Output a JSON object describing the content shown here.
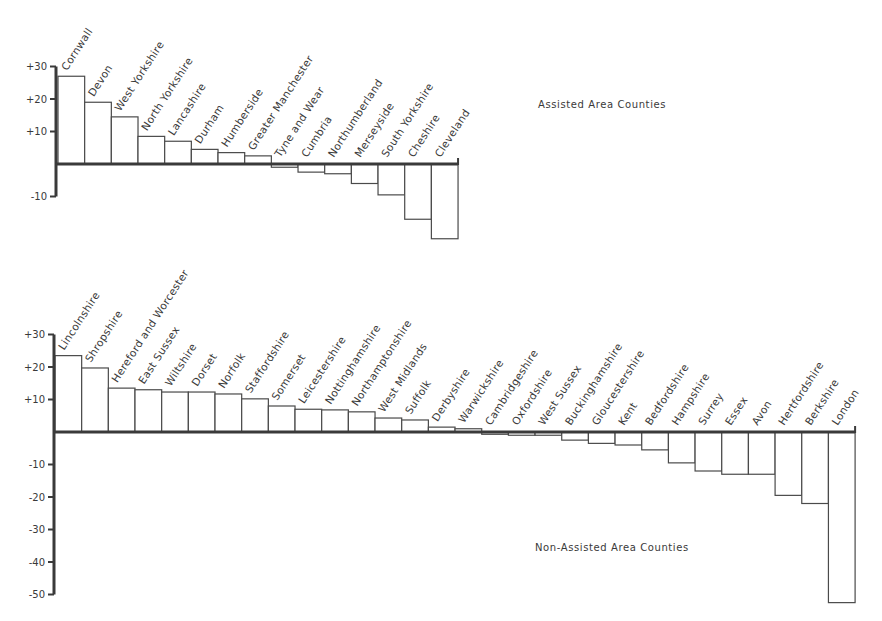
{
  "chart_data": [
    {
      "type": "bar",
      "title": "Assisted Area Counties",
      "xlabel": "",
      "ylabel": "",
      "ylim": [
        -10,
        30
      ],
      "yticks": [
        30,
        20,
        10,
        -10
      ],
      "ytick_labels": [
        "+30",
        "+20",
        "+10",
        "-10"
      ],
      "grid": false,
      "label_rotation": -57,
      "categories": [
        "Cornwall",
        "Devon",
        "West Yorkshire",
        "North Yorkshire",
        "Lancashire",
        "Durham",
        "Humberside",
        "Greater Manchester",
        "Tyne and Wear",
        "Cumbria",
        "Northumberland",
        "Merseyside",
        "South Yorkshire",
        "Cheshire",
        "Cleveland"
      ],
      "values": [
        27,
        19,
        14.5,
        8.5,
        7,
        4.5,
        3.5,
        2.5,
        -1,
        -2.5,
        -3,
        -6,
        -9.5,
        -17,
        -23
      ]
    },
    {
      "type": "bar",
      "title": "Non-Assisted Area Counties",
      "xlabel": "",
      "ylabel": "",
      "ylim": [
        -50,
        30
      ],
      "yticks": [
        30,
        20,
        10,
        -10,
        -20,
        -30,
        -40,
        -50
      ],
      "ytick_labels": [
        "+30",
        "+20",
        "+10",
        "-10",
        "-20",
        "-30",
        "-40",
        "-50"
      ],
      "grid": false,
      "label_rotation": -57,
      "categories": [
        "Lincolnshire",
        "Shropshire",
        "Hereford and Worcester",
        "East Sussex",
        "Wiltshire",
        "Dorset",
        "Norfolk",
        "Staffordshire",
        "Somerset",
        "Leicestershire",
        "Nottinghamshire",
        "Northamptonshire",
        "West Midlands",
        "Suffolk",
        "Derbyshire",
        "Warwickshire",
        "Cambridgeshire",
        "Oxfordshire",
        "West Sussex",
        "Buckinghamshire",
        "Gloucestershire",
        "Kent",
        "Bedfordshire",
        "Hampshire",
        "Surrey",
        "Essex",
        "Avon",
        "Hertfordshire",
        "Berkshire",
        "London"
      ],
      "values": [
        23.5,
        19.7,
        13.5,
        13,
        12.3,
        12.3,
        11.7,
        10.2,
        8,
        7,
        6.8,
        6.2,
        4.3,
        3.7,
        1.5,
        1,
        -0.7,
        -1,
        -1,
        -2.5,
        -3.5,
        -4,
        -5.5,
        -9.5,
        -12,
        -13,
        -13,
        -19.5,
        -22,
        -52.5
      ]
    }
  ],
  "layout": {
    "panels": [
      {
        "axis_x": 56,
        "zero_y": 164,
        "px_per_unit": 3.25,
        "bar_start_x": 58,
        "bar_width": 26.67,
        "title_x": 538,
        "title_y": 108
      },
      {
        "axis_x": 54,
        "zero_y": 432,
        "px_per_unit": 3.25,
        "bar_start_x": 55,
        "bar_width": 26.67,
        "title_x": 535,
        "title_y": 551
      }
    ]
  }
}
